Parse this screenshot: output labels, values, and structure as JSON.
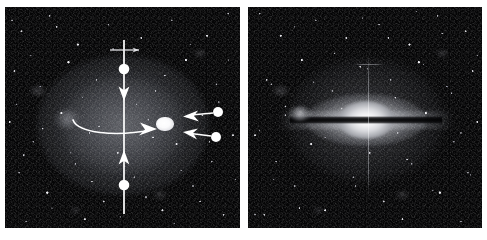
{
  "figure": {
    "background_color": "#ffffff",
    "width": 487,
    "height": 240,
    "panel_count": 2
  },
  "panels": [
    {
      "id": "left",
      "name": "deep-exposure-panel",
      "label": "",
      "description": "Deep exposure showing a diffuse elliptical halo over a dense resolved starfield, with measurement annotations overlaid",
      "x": 5,
      "y": 7,
      "width": 235,
      "height": 221,
      "background_color": "#050506",
      "halo": {
        "name": "diffuse-halo",
        "center_x": 118,
        "center_y": 118,
        "radius_x": 86,
        "radius_y": 70,
        "peak_color": "#7d8088"
      },
      "faint_blob": {
        "name": "faint-companion-blob",
        "center_x": 62,
        "center_y": 112,
        "radius_x": 13,
        "radius_y": 10,
        "color": "#aaacb4"
      },
      "annotations": {
        "color": "#ffffff",
        "stroke_width": 1.6,
        "minor_axis_marker": {
          "name": "minor-axis-double-arrow",
          "type": "double-arrow-with-endpoint-dots",
          "x": 119,
          "y_top": 35,
          "y_bottom": 205,
          "dot_top_y": 62,
          "dot_bottom_y": 178,
          "arrowhead_down_y": 88,
          "arrowhead_up_y": 150,
          "dot_radius": 5.2
        },
        "major_axis_marker": {
          "name": "major-axis-curved-arrow",
          "type": "curved-arrow",
          "x_start": 69,
          "x_end": 150,
          "y": 120,
          "curve_sag": 7
        },
        "pointer_arrows": [
          {
            "name": "pointer-arrow-upper",
            "type": "arrow-with-tail-dot",
            "tip_x": 180,
            "tip_y": 109,
            "tail_x": 210,
            "tail_y": 105,
            "dot_x": 213,
            "dot_y": 105,
            "dot_radius": 5.0
          },
          {
            "name": "pointer-arrow-lower",
            "type": "arrow-with-tail-dot",
            "tip_x": 180,
            "tip_y": 126,
            "tail_x": 208,
            "tail_y": 130,
            "dot_x": 211,
            "dot_y": 130,
            "dot_radius": 5.0
          }
        ],
        "top_tick": {
          "name": "top-horizontal-tick",
          "x_start": 105,
          "x_end": 134,
          "y": 43
        },
        "nucleus_source": {
          "name": "bright-compact-source",
          "center_x": 160,
          "center_y": 117,
          "radius_x": 8.5,
          "radius_y": 6.5,
          "color": "#ffffff"
        }
      }
    },
    {
      "id": "right",
      "name": "short-exposure-panel",
      "label": "",
      "description": "Shorter exposure resolving the bright edge-on galaxy bulge bisected by a dark dust lane, with a vertical diffraction spike",
      "x": 248,
      "y": 7,
      "width": 234,
      "height": 221,
      "background_color": "#050506",
      "galaxy": {
        "name": "edge-on-galaxy",
        "center_x": 118,
        "center_y": 113,
        "halo_radius_x": 78,
        "halo_radius_y": 62,
        "disk_radius_x": 60,
        "disk_radius_y": 26,
        "bulge_radius_x": 28,
        "bulge_radius_y": 19,
        "bulge_color": "#ffffff",
        "dust_lane": {
          "name": "dust-lane",
          "x": 42,
          "y": 110,
          "width": 152,
          "height": 7,
          "color": "#000000"
        }
      },
      "companion": {
        "name": "companion-source",
        "center_x": 52,
        "center_y": 106,
        "radius_x": 9,
        "radius_y": 6,
        "color": "#cdced4"
      },
      "diffraction_spike": {
        "name": "vertical-diffraction-spike",
        "x": 120,
        "y_top": 46,
        "y_bottom": 190,
        "color": "#a5a7ad",
        "cross_tick": {
          "name": "spike-cross-tick",
          "x_start": 106,
          "x_end": 136,
          "y": 57
        }
      }
    }
  ],
  "colors": {
    "background": "#ffffff",
    "sky": "#050506",
    "annotation": "#ffffff",
    "halo": "#7d8088",
    "bulge": "#ffffff",
    "dust_lane": "#000000"
  }
}
